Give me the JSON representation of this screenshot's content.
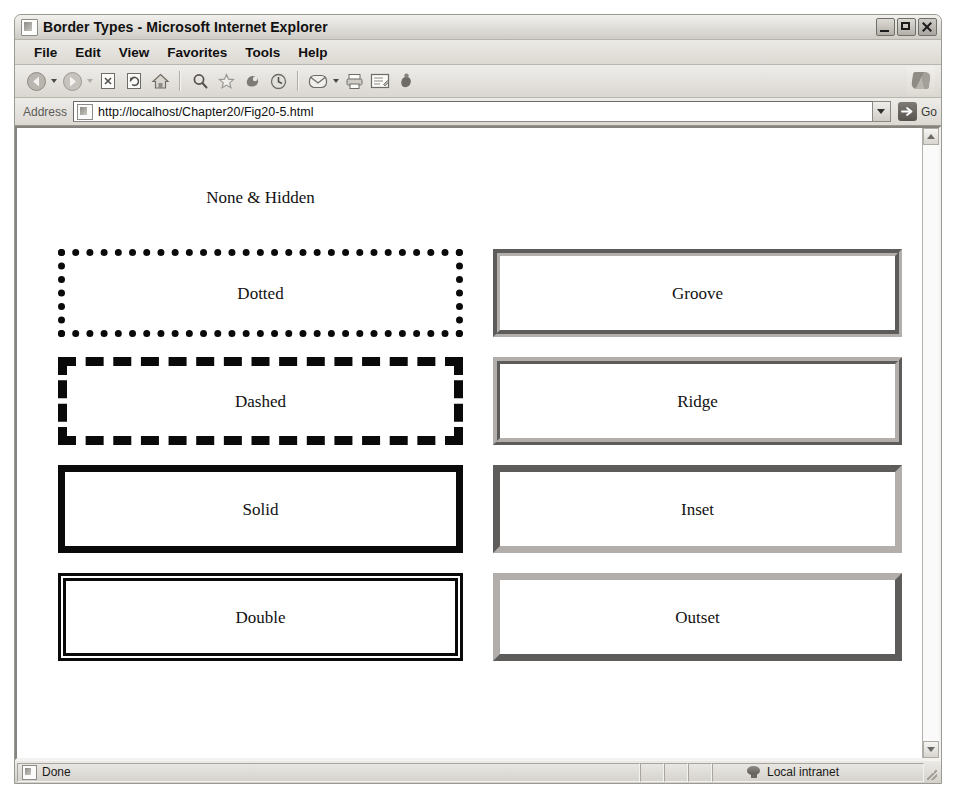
{
  "window": {
    "title": "Border Types - Microsoft Internet Explorer",
    "title_icon": "page-icon",
    "controls": {
      "minimize": "minimize-button",
      "maximize": "maximize-button",
      "close": "close-button"
    }
  },
  "menubar": {
    "items": [
      {
        "label": "File"
      },
      {
        "label": "Edit"
      },
      {
        "label": "View"
      },
      {
        "label": "Favorites"
      },
      {
        "label": "Tools"
      },
      {
        "label": "Help"
      }
    ]
  },
  "toolbar": {
    "buttons": [
      {
        "icon": "back-icon"
      },
      {
        "icon": "back-dropdown-caret-icon"
      },
      {
        "icon": "forward-icon"
      },
      {
        "icon": "forward-dropdown-caret-icon"
      },
      {
        "icon": "stop-icon"
      },
      {
        "icon": "refresh-icon"
      },
      {
        "icon": "home-icon"
      },
      {
        "icon": "search-icon"
      },
      {
        "icon": "favorites-star-icon"
      },
      {
        "icon": "media-icon"
      },
      {
        "icon": "history-icon"
      },
      {
        "icon": "mail-icon"
      },
      {
        "icon": "mail-dropdown-caret-icon"
      },
      {
        "icon": "print-icon"
      },
      {
        "icon": "edit-icon"
      },
      {
        "icon": "messenger-icon"
      }
    ],
    "brand_icon": "ie-logo-icon"
  },
  "address": {
    "label": "Address",
    "url": "http://localhost/Chapter20/Fig20-5.html",
    "page_icon": "page-icon",
    "dropdown_icon": "chevron-down-icon",
    "go_label": "Go",
    "go_icon": "go-arrow-icon"
  },
  "page": {
    "boxes_left": [
      {
        "id": "none",
        "label": "None & Hidden",
        "border_style": "none"
      },
      {
        "id": "dotted",
        "label": "Dotted",
        "border_style": "dotted"
      },
      {
        "id": "dashed",
        "label": "Dashed",
        "border_style": "dashed"
      },
      {
        "id": "solid",
        "label": "Solid",
        "border_style": "solid"
      },
      {
        "id": "double",
        "label": "Double",
        "border_style": "double"
      }
    ],
    "boxes_right": [
      {
        "id": "groove",
        "label": "Groove",
        "border_style": "groove"
      },
      {
        "id": "ridge",
        "label": "Ridge",
        "border_style": "ridge"
      },
      {
        "id": "inset",
        "label": "Inset",
        "border_style": "inset"
      },
      {
        "id": "outset",
        "label": "Outset",
        "border_style": "outset"
      }
    ],
    "border_color_dark": "#0a0a0a",
    "border_color_3d": "#b2aeab",
    "background": "#ffffff"
  },
  "scrollbar": {
    "up_icon": "scroll-up-arrow-icon",
    "down_icon": "scroll-down-arrow-icon"
  },
  "statusbar": {
    "text": "Done",
    "doc_icon": "page-icon",
    "zone": "Local intranet",
    "zone_icon": "intranet-globe-icon",
    "grip_icon": "resize-grip-icon"
  }
}
